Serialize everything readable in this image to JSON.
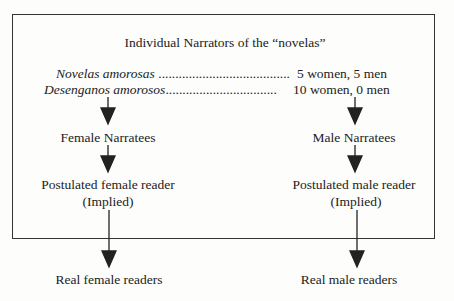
{
  "diagram": {
    "title": "Individual Narrators of the “novelas”",
    "rows": [
      {
        "label": "Novelas amorosas",
        "dots": " .......................................",
        "value": "5 women, 5 men"
      },
      {
        "label": "Desenganos amorosos",
        "dots": ".................................",
        "value": "10 women, 0 men"
      }
    ],
    "left": {
      "narratees": "Female Narratees",
      "implied_line1": "Postulated female reader",
      "implied_line2": "(Implied)",
      "real": "Real female readers"
    },
    "right": {
      "narratees": "Male Narratees",
      "implied_line1": "Postulated male reader",
      "implied_line2": "(Implied)",
      "real": "Real male readers"
    }
  }
}
